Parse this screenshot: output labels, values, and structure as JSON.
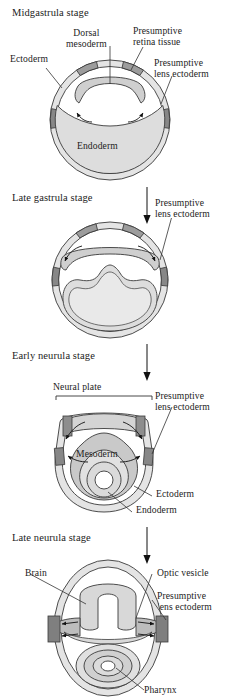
{
  "figure": {
    "type": "biological-diagram",
    "panel_count": 4
  },
  "palette": {
    "ectoderm_light": "#e2e2e2",
    "mesoderm_mid": "#c9c9c9",
    "endoderm_fill": "#dcdcdc",
    "presumptive_dark": "#8a8a8a",
    "presumptive_retina": "#9a9a9a",
    "outline": "#3a3a3a",
    "arrow": "#111111",
    "background": "#ffffff",
    "text": "#1c1c1c"
  },
  "panels": [
    {
      "id": "midgastrula",
      "stage_label": "Midgastrula stage",
      "labels": [
        {
          "key": "ectoderm",
          "text": "Ectoderm"
        },
        {
          "key": "dorsal_mesoderm",
          "text": "Dorsal\nmesoderm"
        },
        {
          "key": "presumptive_retina",
          "text": "Presumptive\nretina tissue"
        },
        {
          "key": "presumptive_lens",
          "text": "Presumptive\nlens ectoderm"
        },
        {
          "key": "endoderm",
          "text": "Endoderm"
        }
      ]
    },
    {
      "id": "late_gastrula",
      "stage_label": "Late gastrula stage",
      "labels": [
        {
          "key": "presumptive_lens",
          "text": "Presumptive\nlens ectoderm"
        }
      ]
    },
    {
      "id": "early_neurula",
      "stage_label": "Early neurula stage",
      "labels": [
        {
          "key": "neural_plate",
          "text": "Neural plate"
        },
        {
          "key": "presumptive_lens",
          "text": "Presumptive\nlens ectoderm"
        },
        {
          "key": "mesoderm",
          "text": "Mesoderm"
        },
        {
          "key": "ectoderm",
          "text": "Ectoderm"
        },
        {
          "key": "endoderm",
          "text": "Endoderm"
        }
      ]
    },
    {
      "id": "late_neurula",
      "stage_label": "Late neurula stage",
      "labels": [
        {
          "key": "brain",
          "text": "Brain"
        },
        {
          "key": "optic_vesicle",
          "text": "Optic vesicle"
        },
        {
          "key": "presumptive_lens",
          "text": "Presumptive\nlens ectoderm"
        },
        {
          "key": "pharynx",
          "text": "Pharynx"
        }
      ]
    }
  ],
  "connectors": [
    {
      "from": "midgastrula",
      "to": "late_gastrula",
      "glyph": "down-arrow"
    },
    {
      "from": "late_gastrula",
      "to": "early_neurula",
      "glyph": "down-arrow"
    },
    {
      "from": "early_neurula",
      "to": "late_neurula",
      "glyph": "down-arrow"
    }
  ]
}
